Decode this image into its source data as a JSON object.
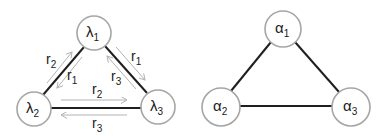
{
  "left_diagram": {
    "nodes": [
      {
        "symbol": "λ",
        "sub": "1"
      },
      {
        "symbol": "λ",
        "sub": "2"
      },
      {
        "symbol": "λ",
        "sub": "3"
      }
    ],
    "rates": {
      "edge12_outer": {
        "symbol": "r",
        "sub": "2"
      },
      "edge12_inner": {
        "symbol": "r",
        "sub": "1"
      },
      "edge13_outer": {
        "symbol": "r",
        "sub": "1"
      },
      "edge13_inner": {
        "symbol": "r",
        "sub": "3"
      },
      "edge23_top": {
        "symbol": "r",
        "sub": "2"
      },
      "edge23_bottom": {
        "symbol": "r",
        "sub": "3"
      }
    }
  },
  "right_diagram": {
    "nodes": [
      {
        "symbol": "α",
        "sub": "1"
      },
      {
        "symbol": "α",
        "sub": "2"
      },
      {
        "symbol": "α",
        "sub": "3"
      }
    ]
  },
  "colors": {
    "node_stroke": "#a6a6a6",
    "edge": "#1f1f1f",
    "arrow": "#b3b3b3"
  }
}
